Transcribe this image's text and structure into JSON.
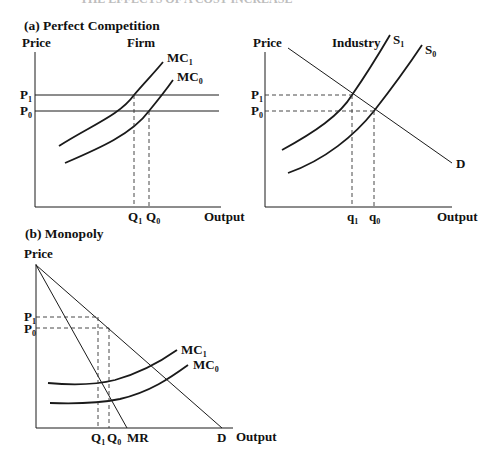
{
  "figure": {
    "top_title_partial": "THE EFFECTS OF A COST INCREASE",
    "panels": [
      {
        "id": "a",
        "label": "(a) Perfect Competition",
        "subpanels": [
          {
            "title": "Firm",
            "y_axis_label": "Price",
            "x_axis_label": "Output",
            "price_labels": [
              {
                "base": "P",
                "sub": "1"
              },
              {
                "base": "P",
                "sub": "0"
              }
            ],
            "quantity_labels": [
              {
                "base": "Q",
                "sub": "1"
              },
              {
                "base": "Q",
                "sub": "0"
              }
            ],
            "curve_labels": [
              {
                "base": "MC",
                "sub": "1"
              },
              {
                "base": "MC",
                "sub": "0"
              }
            ]
          },
          {
            "title": "Industry",
            "y_axis_label": "Price",
            "x_axis_label": "Output",
            "price_labels": [
              {
                "base": "P",
                "sub": "1"
              },
              {
                "base": "P",
                "sub": "0"
              }
            ],
            "quantity_labels": [
              {
                "base": "q",
                "sub": "1"
              },
              {
                "base": "q",
                "sub": "0"
              }
            ],
            "curve_labels": [
              {
                "base": "S",
                "sub": "1"
              },
              {
                "base": "S",
                "sub": "0"
              },
              {
                "base": "D",
                "sub": ""
              }
            ]
          }
        ]
      },
      {
        "id": "b",
        "label": "(b) Monopoly",
        "y_axis_label": "Price",
        "x_axis_label": "Output",
        "price_labels": [
          {
            "base": "P",
            "sub": "1"
          },
          {
            "base": "P",
            "sub": "0"
          }
        ],
        "quantity_labels": [
          {
            "base": "Q",
            "sub": "1"
          },
          {
            "base": "Q",
            "sub": "0"
          }
        ],
        "curve_labels": [
          {
            "base": "MC",
            "sub": "1"
          },
          {
            "base": "MC",
            "sub": "0"
          },
          {
            "base": "MR",
            "sub": ""
          },
          {
            "base": "D",
            "sub": ""
          }
        ]
      }
    ]
  },
  "colors": {
    "ink": "#1a1a1a",
    "background": "#ffffff"
  }
}
